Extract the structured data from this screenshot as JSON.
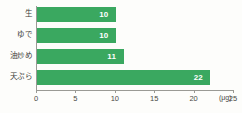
{
  "chart_data": {
    "type": "bar",
    "orientation": "horizontal",
    "title": "",
    "xlabel": "",
    "ylabel": "",
    "unit": "(μg)",
    "categories": [
      "生",
      "ゆで",
      "油炒め",
      "天ぷら"
    ],
    "values": [
      10,
      10,
      11,
      22
    ],
    "value_labels": [
      "10",
      "10",
      "11",
      "22"
    ],
    "xlim": [
      0,
      25
    ],
    "xticks": [
      0,
      5,
      10,
      15,
      20,
      25
    ],
    "xtick_labels": [
      "0",
      "5",
      "10",
      "15",
      "20",
      "25"
    ],
    "grid": false,
    "legend": null,
    "bar_color": "#3aa860",
    "value_label_color": "#ffffff",
    "axis_color": "#9a9a95",
    "background_color": "#fdfdfb"
  }
}
